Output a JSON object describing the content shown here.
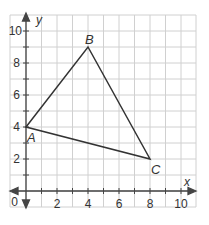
{
  "figure": {
    "axes": {
      "x_label": "x",
      "y_label": "y",
      "origin_label": "0",
      "x_ticks": [
        "2",
        "4",
        "6",
        "8",
        "10"
      ],
      "y_ticks": [
        "2",
        "4",
        "6",
        "8",
        "10"
      ]
    },
    "points": [
      {
        "label": "A",
        "x": 0,
        "y": 4
      },
      {
        "label": "B",
        "x": 4,
        "y": 9
      },
      {
        "label": "C",
        "x": 8,
        "y": 2
      }
    ],
    "colors": {
      "grid": "#d0d0d0",
      "axis": "#444444",
      "triangle": "#333333"
    }
  }
}
